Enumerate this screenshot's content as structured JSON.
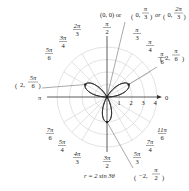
{
  "chart_data": {
    "type": "polar-curve",
    "equation": "r = 2 sin 3θ",
    "caption": "r = 2 sin 3θ",
    "rose": {
      "amplitude": 2,
      "petals": 3,
      "n": 3
    },
    "radial_ticks": [
      "1",
      "2",
      "3",
      "4"
    ],
    "rmax": 4,
    "axis_labels": {
      "zero": "0",
      "pi": "π"
    },
    "angle_labels": [
      {
        "num": "π",
        "den": "2",
        "angle_deg": 90
      },
      {
        "num": "π",
        "den": "3",
        "angle_deg": 60
      },
      {
        "num": "π",
        "den": "4",
        "angle_deg": 45
      },
      {
        "num": "π",
        "den": "6",
        "angle_deg": 30
      },
      {
        "num": "2π",
        "den": "3",
        "angle_deg": 120
      },
      {
        "num": "3π",
        "den": "4",
        "angle_deg": 135
      },
      {
        "num": "5π",
        "den": "6",
        "angle_deg": 150
      },
      {
        "num": "7π",
        "den": "6",
        "angle_deg": 210
      },
      {
        "num": "5π",
        "den": "4",
        "angle_deg": 225
      },
      {
        "num": "4π",
        "den": "3",
        "angle_deg": 240
      },
      {
        "num": "3π",
        "den": "2",
        "angle_deg": 270
      },
      {
        "num": "5π",
        "den": "3",
        "angle_deg": 300
      },
      {
        "num": "7π",
        "den": "4",
        "angle_deg": 315
      },
      {
        "num": "11π",
        "den": "6",
        "angle_deg": 330
      }
    ],
    "annotated_points": [
      {
        "label": "(2, π/6)",
        "r": 2,
        "theta": "π/6"
      },
      {
        "label": "(2, 5π/6)",
        "r": 2,
        "theta": "5π/6"
      },
      {
        "label": "(−2, π/2)",
        "r": -2,
        "theta": "π/2"
      },
      {
        "label": "(0, 0) or (0, π/3) or (0, 2π/3)",
        "r": 0,
        "theta": "0, π/3, 2π/3"
      }
    ],
    "points_text": {
      "p1_r": "2,",
      "p1_num": "π",
      "p1_den": "6",
      "p2_r": "2,",
      "p2_num": "5π",
      "p2_den": "6",
      "p3_r": "−2,",
      "p3_num": "π",
      "p3_den": "2",
      "pole_a": "(0, 0) or",
      "pole_b_r": "0,",
      "pole_b_num": "π",
      "pole_b_den": "3",
      "pole_or": "or",
      "pole_c_r": "0,",
      "pole_c_num": "2π",
      "pole_c_den": "3"
    },
    "colors": {
      "grid": "#cfcfcf",
      "curve": "#333333",
      "axis": "#333333"
    }
  }
}
